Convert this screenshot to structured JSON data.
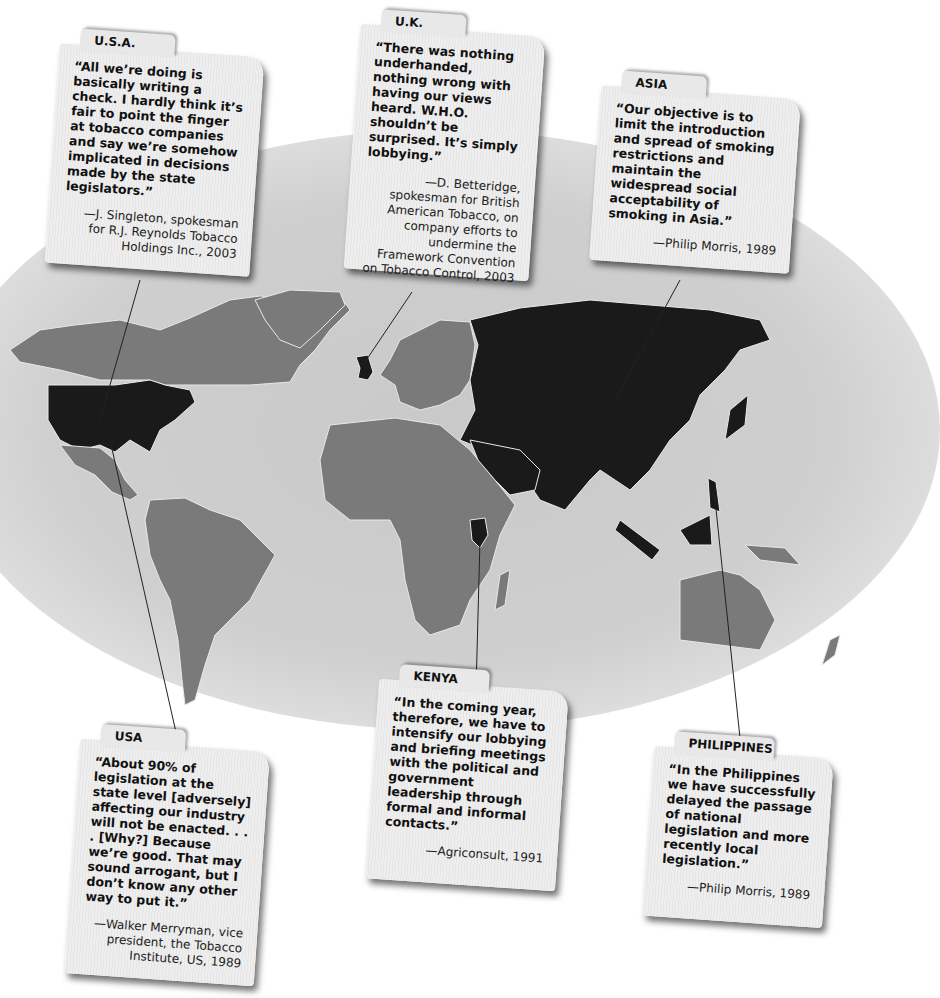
{
  "header": {
    "title_fragment": "Industry Lobbying Around the World"
  },
  "map": {
    "colors": {
      "highlighted_country": "#1a1a1a",
      "other_land": "#7a7a7a",
      "ocean": "#cccccc",
      "borders": "#e8e8e8",
      "background": "#ffffff"
    },
    "highlighted_regions": [
      "United States",
      "United Kingdom",
      "Russia & Asia",
      "Middle East",
      "Kenya",
      "Southeast Asia / Philippines"
    ]
  },
  "cards": [
    {
      "id": "usa-2003",
      "label": "U.S.A.",
      "quote": "“All we’re doing is basically writing a check. I hardly think it’s fair to point the finger at tobacco companies and say we’re somehow implicated in decisions made by the state legislators.”",
      "attribution": "—J. Singleton, spokesman for R.J. Reynolds Tobacco Holdings Inc., 2003"
    },
    {
      "id": "uk-2003",
      "label": "U.K.",
      "quote": "“There was nothing underhanded, nothing wrong with having our views heard. W.H.O. shouldn’t be surprised. It’s simply lobbying.”",
      "attribution": "—D. Betteridge, spokesman for British American Tobacco, on company efforts to undermine the Framework Convention on Tobacco Control, 2003"
    },
    {
      "id": "asia-1989",
      "label": "ASIA",
      "quote": "“Our objective is to limit the introduction and spread of smoking restrictions and maintain the widespread social acceptability of smoking in Asia.”",
      "attribution": "—Philip Morris, 1989"
    },
    {
      "id": "usa-1989",
      "label": "USA",
      "quote": "“About 90% of legislation at the state level [adversely] affecting our industry will not be enacted. . . . [Why?] Because we’re good. That may sound arrogant, but I don’t know any other way to put it.”",
      "attribution": "—Walker Merryman, vice president, the Tobacco Institute, US, 1989"
    },
    {
      "id": "kenya-1991",
      "label": "KENYA",
      "quote": "“In the coming year, therefore, we have to intensify our lobbying and briefing meetings with the political and government leadership through formal and informal contacts.”",
      "attribution": "—Agriconsult, 1991"
    },
    {
      "id": "philippines-1989",
      "label": "PHILIPPINES",
      "quote": "“In the Philippines we have successfully delayed the passage of national legislation and more recently local legislation.”",
      "attribution": "—Philip Morris, 1989"
    }
  ]
}
